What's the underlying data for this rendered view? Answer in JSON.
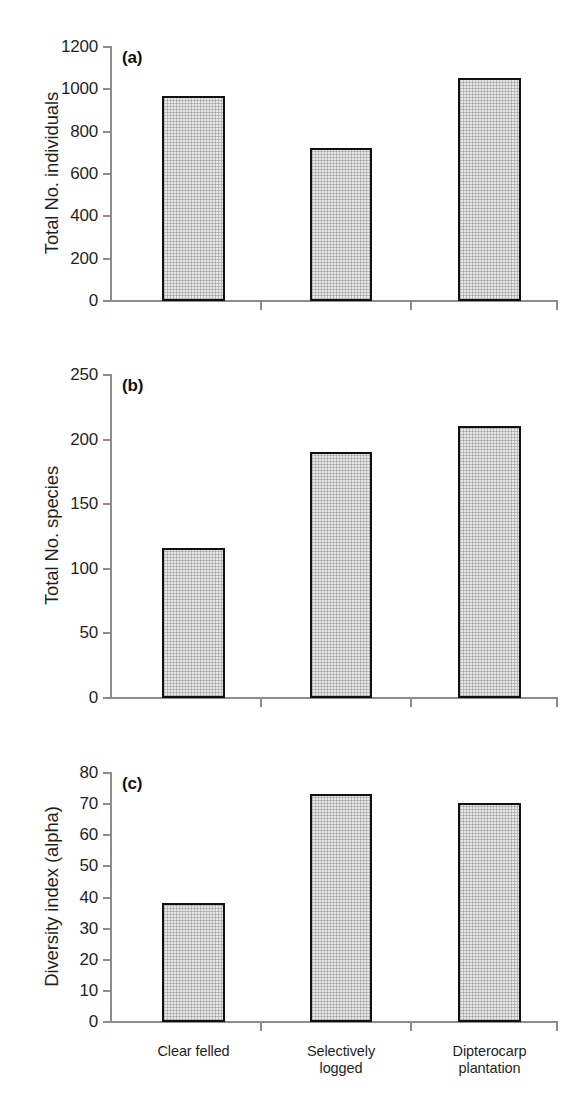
{
  "chart_data": [
    {
      "type": "bar",
      "panel": "(a)",
      "title": "",
      "xlabel": "",
      "ylabel": "Total No. individuals",
      "categories": [
        "Clear felled",
        "Selectively logged",
        "Dipterocarp plantation"
      ],
      "values": [
        965,
        720,
        1050
      ],
      "ylim": [
        0,
        1200
      ],
      "yticks": [
        0,
        200,
        400,
        600,
        800,
        1000,
        1200
      ],
      "ytick_labels": [
        "0",
        "200",
        "400",
        "600",
        "800",
        "1000",
        "1200"
      ],
      "grid": false,
      "legend": "none"
    },
    {
      "type": "bar",
      "panel": "(b)",
      "title": "",
      "xlabel": "",
      "ylabel": "Total No. species",
      "categories": [
        "Clear felled",
        "Selectively logged",
        "Dipterocarp plantation"
      ],
      "values": [
        115,
        190,
        210
      ],
      "ylim": [
        0,
        250
      ],
      "yticks": [
        0,
        50,
        100,
        150,
        200,
        250
      ],
      "ytick_labels": [
        "0",
        "50",
        "100",
        "150",
        "200",
        "250"
      ],
      "grid": false,
      "legend": "none"
    },
    {
      "type": "bar",
      "panel": "(c)",
      "title": "",
      "xlabel": "",
      "ylabel": "Diversity index (alpha)",
      "categories": [
        "Clear felled",
        "Selectively logged",
        "Dipterocarp plantation"
      ],
      "values": [
        38,
        73,
        70
      ],
      "ylim": [
        0,
        80
      ],
      "yticks": [
        0,
        10,
        20,
        30,
        40,
        50,
        60,
        70,
        80
      ],
      "ytick_labels": [
        "0",
        "10",
        "20",
        "30",
        "40",
        "50",
        "60",
        "70",
        "80"
      ],
      "grid": false,
      "legend": "none"
    }
  ],
  "category_labels": [
    "Clear felled",
    "Selectively\nlogged",
    "Dipterocarp\nplantation"
  ],
  "colors": {
    "bar_fill": "#e9e9e9",
    "bar_edge": "#111111",
    "axis": "#8c8c8c",
    "text": "#1f1f1f",
    "background": "#ffffff"
  }
}
